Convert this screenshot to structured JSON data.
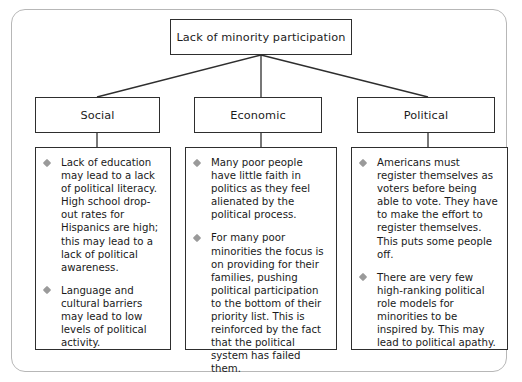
{
  "diagram": {
    "title_node": {
      "label": "Lack of minority participation"
    },
    "categories": [
      {
        "label": "Social"
      },
      {
        "label": "Economic"
      },
      {
        "label": "Political"
      }
    ],
    "columns": [
      {
        "category": "Social",
        "bullets": [
          "Lack of education may lead to a lack of political literacy. High school drop-out rates for Hispanics are high; this may lead to a lack of political awareness.",
          "Language and cultural barriers may lead to low levels of political activity."
        ]
      },
      {
        "category": "Economic",
        "bullets": [
          "Many poor people have little faith in politics as they feel alienated by the political process.",
          "For many poor minorities the focus is on providing for their families, pushing political participation to the bottom of their priority list. This is reinforced by the fact that the political system has failed them."
        ]
      },
      {
        "category": "Political",
        "bullets": [
          "Americans must register themselves as voters before being able to vote. They have to make the effort to register themselves. This puts some people off.",
          "There are very few high-ranking political role models for minorities to be inspired by. This may lead to political apathy."
        ]
      }
    ],
    "colors": {
      "frame_border": "#b7b7b7",
      "box_border": "#2e2e2e",
      "text": "#1a1a1a",
      "bullet": "#9a9a9a",
      "connector": "#2e2e2e",
      "background": "#ffffff"
    }
  }
}
